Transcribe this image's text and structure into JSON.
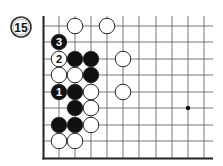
{
  "diagram": {
    "problem_number": "15",
    "board": {
      "columns_x": [
        59,
        75,
        91,
        107,
        123,
        139,
        156,
        172,
        188,
        204
      ],
      "rows_y": [
        26,
        42,
        59,
        75,
        92,
        108,
        125,
        141
      ],
      "left_edge_x": 43.5,
      "bottom_edge_y": 158.5,
      "open_top_y": 16,
      "open_right_x": 213,
      "star_points": [
        {
          "col": 9,
          "row": 5
        }
      ]
    },
    "stones": [
      {
        "color": "white",
        "col": 2,
        "row": 0,
        "label": ""
      },
      {
        "color": "white",
        "col": 4,
        "row": 0,
        "label": ""
      },
      {
        "color": "black",
        "col": 1,
        "row": 1,
        "label": "3"
      },
      {
        "color": "white",
        "col": 1,
        "row": 2,
        "label": "2"
      },
      {
        "color": "black",
        "col": 2,
        "row": 2,
        "label": ""
      },
      {
        "color": "black",
        "col": 3,
        "row": 2,
        "label": ""
      },
      {
        "color": "white",
        "col": 5,
        "row": 2,
        "label": ""
      },
      {
        "color": "white",
        "col": 1,
        "row": 3,
        "label": ""
      },
      {
        "color": "white",
        "col": 2,
        "row": 3,
        "label": ""
      },
      {
        "color": "black",
        "col": 3,
        "row": 3,
        "label": ""
      },
      {
        "color": "black",
        "col": 1,
        "row": 4,
        "label": "1"
      },
      {
        "color": "black",
        "col": 2,
        "row": 4,
        "label": ""
      },
      {
        "color": "white",
        "col": 3,
        "row": 4,
        "label": ""
      },
      {
        "color": "white",
        "col": 5,
        "row": 4,
        "label": ""
      },
      {
        "color": "black",
        "col": 2,
        "row": 5,
        "label": ""
      },
      {
        "color": "white",
        "col": 3,
        "row": 5,
        "label": ""
      },
      {
        "color": "black",
        "col": 1,
        "row": 6,
        "label": ""
      },
      {
        "color": "black",
        "col": 2,
        "row": 6,
        "label": ""
      },
      {
        "color": "white",
        "col": 3,
        "row": 6,
        "label": ""
      },
      {
        "color": "white",
        "col": 1,
        "row": 7,
        "label": ""
      },
      {
        "color": "white",
        "col": 2,
        "row": 7,
        "label": ""
      }
    ],
    "colors": {
      "black_stone": "#111111",
      "white_stone": "#ffffff",
      "grid_line": "#555555",
      "edge_line": "#222222",
      "badge_ring": "#333333",
      "badge_inner": "#dddddd"
    }
  }
}
